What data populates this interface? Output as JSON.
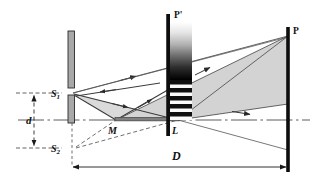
{
  "figure": {
    "background_color": "#ffffff",
    "width": 315,
    "height": 185
  },
  "labels": {
    "source_1": "S",
    "source_1_sub": "1",
    "source_2": "S",
    "source_2_sub": "2",
    "mirror_point": "M",
    "lens_point": "L",
    "screen_near": "P'",
    "screen_far": "P",
    "separation": "d",
    "distance": "D"
  },
  "elements": {
    "barrier_name": "slit-barrier",
    "mirror_name": "lloyd-mirror",
    "screen_near_name": "fringe-screen",
    "screen_far_name": "observation-screen",
    "beam_name": "light-beam-cone",
    "axis_name": "optical-axis"
  },
  "colors": {
    "ink": "#111111",
    "barrier_fill": "#a8a8a8",
    "barrier_stroke": "#2a2a2a",
    "beam_fill": "#d3d3d3",
    "beam_stroke": "#555555",
    "ray_stroke": "#3a3a3a",
    "dashed_stroke": "#4a4a4a",
    "screen_black": "#0d0d0d",
    "mirror_fill": "#7f7f7f",
    "axis_stroke": "#4a4a4a",
    "fringe_dark": "#101010",
    "fringe_light": "#fbfbfb"
  },
  "geometry": {
    "axis_y": 120,
    "s1": {
      "x": 72,
      "y": 93
    },
    "s2": {
      "x": 72,
      "y": 148
    },
    "m": {
      "x": 116,
      "y": 120
    },
    "l": {
      "x": 178,
      "y": 120
    },
    "screen_near_x": 168,
    "screen_far_x": 288,
    "d_dim_x": 34,
    "d_dim_top": 93,
    "d_dim_bottom": 148,
    "D_dim_y": 167,
    "D_dim_left": 72,
    "D_dim_right": 288
  },
  "fringe_pattern": {
    "gradient_top_y": 22,
    "gradient_bottom_y": 80,
    "gradient_from": "#ffffff",
    "gradient_to": "#000000",
    "stripe_region_top": 80,
    "stripe_region_bottom": 120,
    "stripe_count": 5,
    "stripe_height": 4,
    "stripe_gap": 4,
    "band_left_x": 168,
    "band_right_x": 192
  }
}
